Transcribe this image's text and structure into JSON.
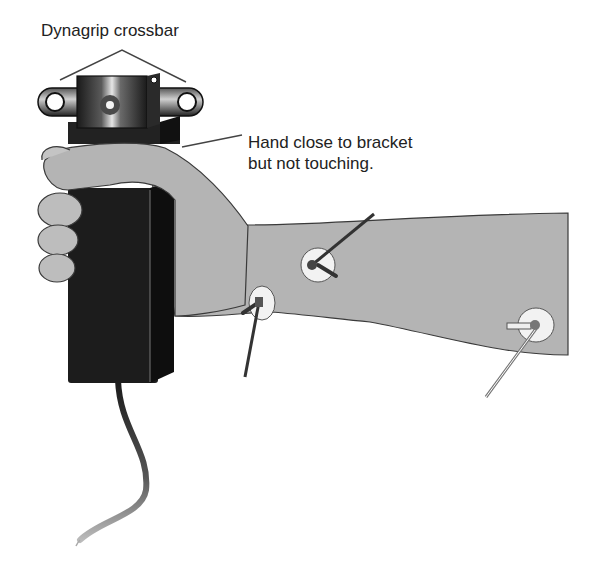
{
  "figure": {
    "labels": {
      "crossbar": "Dynagrip crossbar",
      "hand_line1": "Hand close to bracket",
      "hand_line2": "but not touching."
    },
    "colors": {
      "background": "#ffffff",
      "skin": "#b4b4b4",
      "skin_outline": "#3a3a3a",
      "device": "#1c1c1c",
      "metal_highlight": "#e8e8e8",
      "electrode_pad": "#f2f2f2",
      "leader_line": "#444444",
      "text": "#222222"
    },
    "electrodes": [
      {
        "name": "forearm-upper-electrode",
        "x": 318,
        "y": 263
      },
      {
        "name": "wrist-electrode",
        "x": 263,
        "y": 306
      },
      {
        "name": "elbow-electrode",
        "x": 536,
        "y": 325
      }
    ]
  }
}
